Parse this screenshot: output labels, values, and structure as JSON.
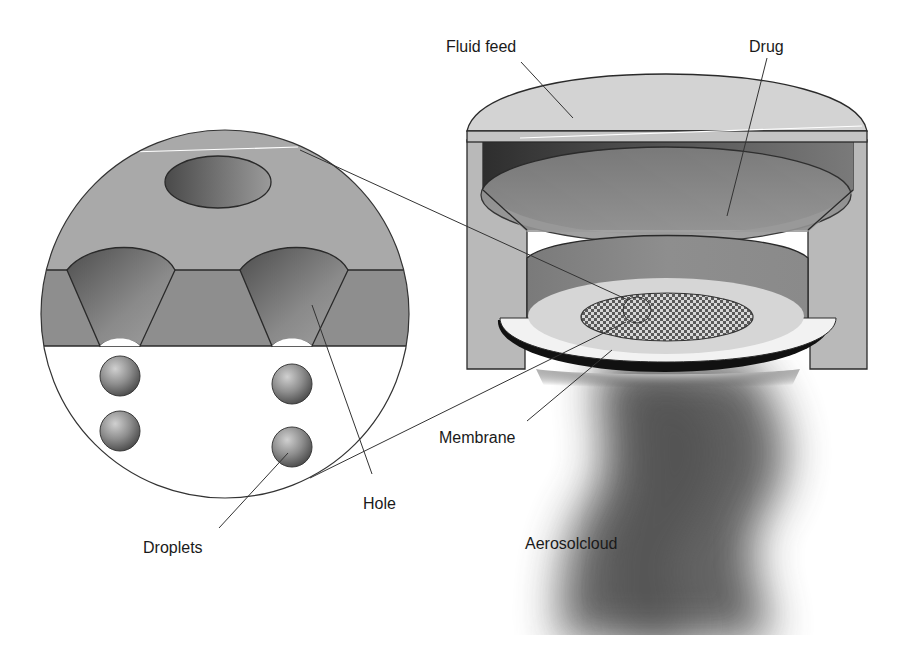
{
  "figure": {
    "labels": {
      "fluid_feed": "Fluid feed",
      "drug": "Drug",
      "membrane": "Membrane",
      "hole": "Hole",
      "droplets": "Droplets",
      "aerosol_cloud": "Aerosolcloud"
    },
    "colors": {
      "housing": "#b9b9b9",
      "lid": "#d2d2d2",
      "cavity_dark": "#3c3c3c",
      "drug_fluid": "#8a8a8a",
      "membrane_plate": "#d9d9d9",
      "membrane_rim": "#111111",
      "mesh": "#555555",
      "detail_upper": "#a9a9a9",
      "detail_membrane": "#8c8c8c",
      "droplet": "#8f8f8f",
      "aerosol": "#5a5a5a"
    }
  }
}
